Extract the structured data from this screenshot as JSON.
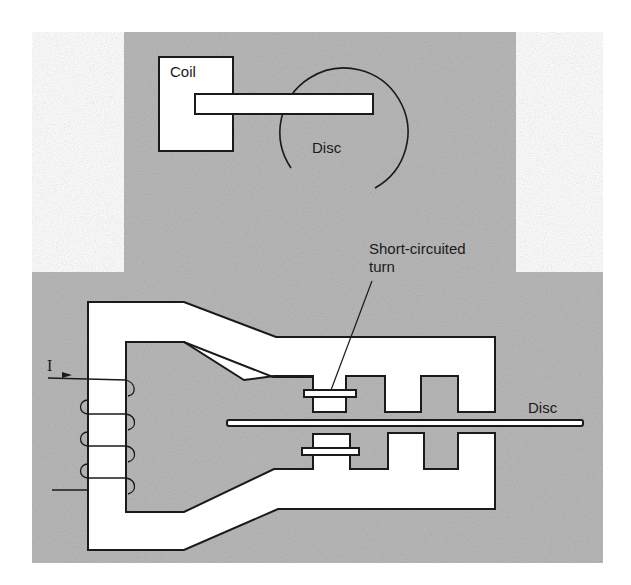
{
  "figure": {
    "colors": {
      "background": "#ffffff",
      "panel": "#b9b9b9",
      "stroke": "#1a1a1a",
      "core_fill": "#ffffff"
    },
    "top_view": {
      "coil_label": "Coil",
      "disc_label": "Disc"
    },
    "side_view": {
      "current_label": "I",
      "short_circuited_turn_label_line1": "Short-circuited",
      "short_circuited_turn_label_line2": "turn",
      "disc_label": "Disc",
      "coil_turns": 4
    }
  }
}
